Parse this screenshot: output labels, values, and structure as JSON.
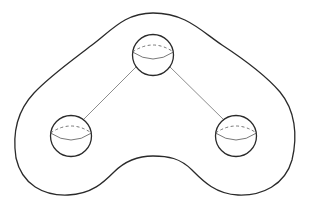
{
  "diagram": {
    "type": "surface-with-handles",
    "stroke_color": "#2a2a2a",
    "line_color": "#707070",
    "background": "#ffffff",
    "outline": {
      "label": ""
    },
    "spheres": [
      {
        "id": "top",
        "cx": 153,
        "cy": 55,
        "r": 20
      },
      {
        "id": "left",
        "cx": 71,
        "cy": 136,
        "r": 20
      },
      {
        "id": "right",
        "cx": 236,
        "cy": 136,
        "r": 20
      }
    ],
    "connections": [
      {
        "from": "top",
        "to": "left"
      },
      {
        "from": "top",
        "to": "right"
      }
    ]
  }
}
